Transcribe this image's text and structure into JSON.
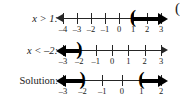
{
  "figure": {
    "stray_mark": "(",
    "rows": [
      {
        "id": "row-x-greater-than-1",
        "label": "x > 1:",
        "label_style": "italic",
        "tick_labels": [
          "–4",
          "–3",
          "–2",
          "–1",
          "0",
          "1",
          "2",
          "3"
        ],
        "tick_values": [
          -4,
          -3,
          -2,
          -1,
          0,
          1,
          2,
          3
        ],
        "bracket": {
          "glyph": "(",
          "at_value": 1,
          "type": "open"
        },
        "ray_direction": "right",
        "axis_arrow_left": true,
        "axis_arrow_right": false
      },
      {
        "id": "row-x-less-than-neg2",
        "label": "x < –2:",
        "label_style": "italic",
        "tick_labels": [
          "–3",
          "–2",
          "–1",
          "0",
          "1",
          "2",
          "3"
        ],
        "tick_values": [
          -3,
          -2,
          -1,
          0,
          1,
          2,
          3
        ],
        "bracket": {
          "glyph": ")",
          "at_value": -2,
          "type": "open"
        },
        "ray_direction": "left",
        "axis_arrow_left": false,
        "axis_arrow_right": true
      },
      {
        "id": "row-solution",
        "label": "Solution:",
        "label_style": "upright",
        "tick_labels": [
          "–3",
          "–2",
          "–1",
          "0",
          "1",
          "2"
        ],
        "tick_values": [
          -3,
          -2,
          -1,
          0,
          1,
          2
        ],
        "bracket_left": {
          "glyph": ")",
          "at_value": -2,
          "type": "open"
        },
        "bracket_right": {
          "glyph": "(",
          "at_value": 1,
          "type": "open"
        },
        "ray_direction": "both",
        "axis_arrow_left": false,
        "axis_arrow_right": false
      }
    ],
    "colors": {
      "ink": "#000000",
      "axis": "#262626",
      "background": "#ffffff"
    }
  }
}
